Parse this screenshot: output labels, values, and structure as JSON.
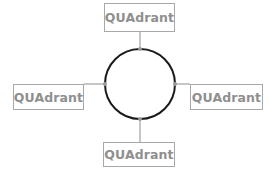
{
  "diagram": {
    "center": {
      "shape": "circle",
      "stroke": "#1a1a1a"
    },
    "connector_color": "#a0a0a0",
    "box_border_color": "#a8a8a8",
    "text_color": "#8f8f8f",
    "nodes": [
      {
        "position": "top",
        "label": "QUAdrant"
      },
      {
        "position": "left",
        "label": "QUAdrant"
      },
      {
        "position": "right",
        "label": "QUAdrant"
      },
      {
        "position": "bottom",
        "label": "QUAdrant"
      }
    ]
  }
}
